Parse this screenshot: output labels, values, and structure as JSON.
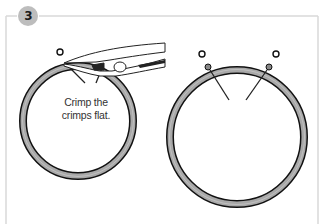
{
  "step": {
    "number": "3",
    "badge_color": "#bdbdbd"
  },
  "caption": {
    "line1": "Crimp the",
    "line2": "crimps flat."
  },
  "colors": {
    "frame": "#d9d9d9",
    "ring_fill": "#a8a8a8",
    "ring_edge": "#111111",
    "line": "#222222"
  },
  "panels": [
    {
      "name": "left-panel",
      "description": "Pliers crimping the crimps on the ring"
    },
    {
      "name": "right-panel",
      "description": "Finished ring with flattened crimps"
    }
  ]
}
